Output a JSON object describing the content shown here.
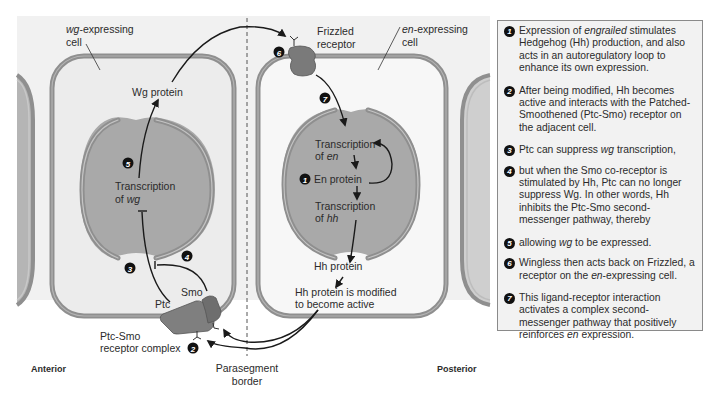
{
  "colors": {
    "background": "#f1f1f1",
    "cytoplasm": "#eeeeee",
    "membrane": "#8f8f8f",
    "nucleus": "#a9a9a9",
    "receptor": "#7a7a7a",
    "arrow": "#1a1a1a",
    "panel_bg": "#f2f2f2"
  },
  "left_cell": {
    "label_italic": "wg",
    "label_rest": "-expressing",
    "label_line2": "cell",
    "wg_protein": "Wg protein",
    "transcription_line1": "Transcription",
    "transcription_line2_prefix": "of ",
    "transcription_line2_gene": "wg",
    "ptc": "Ptc",
    "smo": "Smo",
    "receptor_complex_line1": "Ptc-Smo",
    "receptor_complex_line2": "receptor complex"
  },
  "right_cell": {
    "label_italic": "en",
    "label_rest": "-expressing",
    "label_line2": "cell",
    "frizzled_line1": "Frizzled",
    "frizzled_line2": "receptor",
    "transcription_en_line1": "Transcription",
    "transcription_en_prefix": "of ",
    "transcription_en_gene": "en",
    "en_protein": "En protein",
    "transcription_hh_line1": "Transcription",
    "transcription_hh_prefix": "of ",
    "transcription_hh_gene": "hh",
    "hh_protein": "Hh protein",
    "hh_modified_line1": "Hh protein is modified",
    "hh_modified_line2": "to become active"
  },
  "axis_labels": {
    "anterior": "Anterior",
    "posterior": "Posterior",
    "border_line1": "Parasegment",
    "border_line2": "border"
  },
  "badges": [
    "1",
    "2",
    "3",
    "4",
    "5",
    "6",
    "7"
  ],
  "steps": [
    {
      "num": "1",
      "parts": [
        {
          "t": "Expression of "
        },
        {
          "t": "engrailed",
          "i": true
        },
        {
          "t": " stimulates Hedgehog (Hh) production, and also acts in an autoregulatory loop to enhance its own expression."
        }
      ]
    },
    {
      "num": "2",
      "parts": [
        {
          "t": "After being modified, Hh becomes active and interacts with the Patched-Smoothened (Ptc-Smo) receptor on the adjacent cell."
        }
      ]
    },
    {
      "num": "3",
      "parts": [
        {
          "t": "Ptc can suppress "
        },
        {
          "t": "wg",
          "i": true
        },
        {
          "t": " transcription,"
        }
      ]
    },
    {
      "num": "4",
      "parts": [
        {
          "t": "but when the Smo co-receptor is stimulated by Hh, Ptc can no longer suppress Wg. In other words, Hh inhibits the Ptc-Smo second-messenger pathway, thereby"
        }
      ]
    },
    {
      "num": "5",
      "parts": [
        {
          "t": "allowing "
        },
        {
          "t": "wg",
          "i": true
        },
        {
          "t": " to be expressed."
        }
      ]
    },
    {
      "num": "6",
      "parts": [
        {
          "t": "Wingless then acts back on Frizzled, a receptor on the "
        },
        {
          "t": "en",
          "i": true
        },
        {
          "t": "-expressing cell."
        }
      ]
    },
    {
      "num": "7",
      "parts": [
        {
          "t": "This ligand-receptor interaction activates a complex second-messenger pathway that positively reinforces "
        },
        {
          "t": "en",
          "i": true
        },
        {
          "t": " expression."
        }
      ]
    }
  ]
}
